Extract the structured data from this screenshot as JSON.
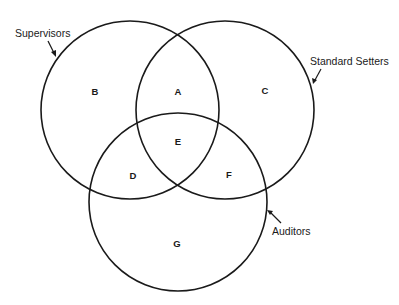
{
  "diagram": {
    "type": "venn",
    "sets": [
      {
        "id": "supervisors",
        "label": "Supervisors",
        "cx": 130,
        "cy": 110,
        "r": 89
      },
      {
        "id": "standard_setters",
        "label": "Standard Setters",
        "cx": 225,
        "cy": 110,
        "r": 89
      },
      {
        "id": "auditors",
        "label": "Auditors",
        "cx": 178,
        "cy": 202,
        "r": 89
      }
    ],
    "regions": [
      {
        "label": "A",
        "x": 178,
        "y": 91
      },
      {
        "label": "B",
        "x": 95,
        "y": 91
      },
      {
        "label": "C",
        "x": 265,
        "y": 90
      },
      {
        "label": "D",
        "x": 133,
        "y": 175
      },
      {
        "label": "E",
        "x": 178,
        "y": 141
      },
      {
        "label": "F",
        "x": 229,
        "y": 174
      },
      {
        "label": "G",
        "x": 177,
        "y": 243
      }
    ],
    "set_labels": {
      "supervisors": "Supervisors",
      "standard_setters": "Standard Setters",
      "auditors": "Auditors"
    },
    "stroke_color": "#1a1a1a",
    "background": "#ffffff"
  }
}
